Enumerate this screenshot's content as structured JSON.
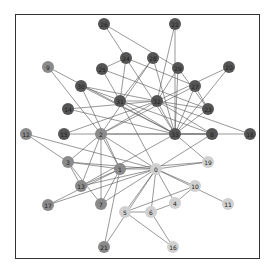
{
  "graph": {
    "title": "",
    "colors": {
      "dark": "#555555",
      "mid": "#8a8a8a",
      "light": "#d0d0d0",
      "edge": "#555555",
      "frame": "#333333"
    },
    "nodes": [
      {
        "id": "0",
        "x": 156,
        "y": 169,
        "shade": "light"
      },
      {
        "id": "1",
        "x": 120,
        "y": 169,
        "shade": "mid"
      },
      {
        "id": "2",
        "x": 101,
        "y": 134,
        "shade": "mid"
      },
      {
        "id": "3",
        "x": 68,
        "y": 162,
        "shade": "mid"
      },
      {
        "id": "4",
        "x": 175,
        "y": 203,
        "shade": "light"
      },
      {
        "id": "5",
        "x": 125,
        "y": 212,
        "shade": "light"
      },
      {
        "id": "6",
        "x": 151,
        "y": 212,
        "shade": "light"
      },
      {
        "id": "7",
        "x": 101,
        "y": 204,
        "shade": "mid"
      },
      {
        "id": "8",
        "x": 212,
        "y": 134,
        "shade": "dark"
      },
      {
        "id": "9",
        "x": 48,
        "y": 67,
        "shade": "mid"
      },
      {
        "id": "10",
        "x": 195,
        "y": 186,
        "shade": "light"
      },
      {
        "id": "11",
        "x": 228,
        "y": 204,
        "shade": "light"
      },
      {
        "id": "12",
        "x": 26,
        "y": 134,
        "shade": "mid"
      },
      {
        "id": "13",
        "x": 81,
        "y": 186,
        "shade": "mid"
      },
      {
        "id": "14",
        "x": 68,
        "y": 109,
        "shade": "dark"
      },
      {
        "id": "15",
        "x": 64,
        "y": 134,
        "shade": "dark"
      },
      {
        "id": "16",
        "x": 173,
        "y": 247,
        "shade": "light"
      },
      {
        "id": "17",
        "x": 48,
        "y": 205,
        "shade": "mid"
      },
      {
        "id": "18",
        "x": 250,
        "y": 134,
        "shade": "dark"
      },
      {
        "id": "19",
        "x": 208,
        "y": 162,
        "shade": "light"
      },
      {
        "id": "20",
        "x": 229,
        "y": 67,
        "shade": "dark"
      },
      {
        "id": "21",
        "x": 104,
        "y": 247,
        "shade": "mid"
      },
      {
        "id": "22",
        "x": 175,
        "y": 24,
        "shade": "dark"
      },
      {
        "id": "23",
        "x": 208,
        "y": 109,
        "shade": "dark"
      },
      {
        "id": "24",
        "x": 126,
        "y": 58,
        "shade": "dark"
      },
      {
        "id": "25",
        "x": 102,
        "y": 69,
        "shade": "dark"
      },
      {
        "id": "26",
        "x": 104,
        "y": 24,
        "shade": "dark"
      },
      {
        "id": "27",
        "x": 195,
        "y": 86,
        "shade": "dark"
      },
      {
        "id": "28",
        "x": 153,
        "y": 58,
        "shade": "dark"
      },
      {
        "id": "29",
        "x": 178,
        "y": 68,
        "shade": "dark"
      },
      {
        "id": "30",
        "x": 81,
        "y": 86,
        "shade": "dark"
      },
      {
        "id": "31",
        "x": 120,
        "y": 101,
        "shade": "dark"
      },
      {
        "id": "32",
        "x": 157,
        "y": 101,
        "shade": "dark"
      },
      {
        "id": "33",
        "x": 175,
        "y": 134,
        "shade": "dark"
      }
    ],
    "edges": [
      [
        "0",
        "1"
      ],
      [
        "0",
        "2"
      ],
      [
        "0",
        "3"
      ],
      [
        "0",
        "4"
      ],
      [
        "0",
        "5"
      ],
      [
        "0",
        "6"
      ],
      [
        "0",
        "7"
      ],
      [
        "0",
        "8"
      ],
      [
        "0",
        "10"
      ],
      [
        "0",
        "11"
      ],
      [
        "0",
        "12"
      ],
      [
        "0",
        "13"
      ],
      [
        "0",
        "17"
      ],
      [
        "0",
        "19"
      ],
      [
        "0",
        "21"
      ],
      [
        "0",
        "31"
      ],
      [
        "1",
        "2"
      ],
      [
        "1",
        "3"
      ],
      [
        "1",
        "7"
      ],
      [
        "1",
        "13"
      ],
      [
        "1",
        "17"
      ],
      [
        "1",
        "19"
      ],
      [
        "1",
        "21"
      ],
      [
        "1",
        "30"
      ],
      [
        "2",
        "3"
      ],
      [
        "2",
        "7"
      ],
      [
        "2",
        "8"
      ],
      [
        "2",
        "9"
      ],
      [
        "2",
        "13"
      ],
      [
        "2",
        "27"
      ],
      [
        "2",
        "28"
      ],
      [
        "2",
        "32"
      ],
      [
        "3",
        "7"
      ],
      [
        "3",
        "12"
      ],
      [
        "3",
        "13"
      ],
      [
        "4",
        "6"
      ],
      [
        "4",
        "10"
      ],
      [
        "5",
        "6"
      ],
      [
        "5",
        "10"
      ],
      [
        "5",
        "16"
      ],
      [
        "6",
        "16"
      ],
      [
        "8",
        "30"
      ],
      [
        "8",
        "32"
      ],
      [
        "8",
        "33"
      ],
      [
        "9",
        "33"
      ],
      [
        "13",
        "33"
      ],
      [
        "14",
        "32"
      ],
      [
        "14",
        "33"
      ],
      [
        "15",
        "32"
      ],
      [
        "15",
        "33"
      ],
      [
        "18",
        "32"
      ],
      [
        "18",
        "33"
      ],
      [
        "19",
        "33"
      ],
      [
        "20",
        "32"
      ],
      [
        "20",
        "33"
      ],
      [
        "22",
        "32"
      ],
      [
        "22",
        "33"
      ],
      [
        "23",
        "25"
      ],
      [
        "23",
        "27"
      ],
      [
        "23",
        "29"
      ],
      [
        "23",
        "32"
      ],
      [
        "23",
        "33"
      ],
      [
        "24",
        "25"
      ],
      [
        "24",
        "27"
      ],
      [
        "24",
        "31"
      ],
      [
        "25",
        "31"
      ],
      [
        "26",
        "29"
      ],
      [
        "26",
        "33"
      ],
      [
        "27",
        "33"
      ],
      [
        "28",
        "31"
      ],
      [
        "28",
        "33"
      ],
      [
        "29",
        "32"
      ],
      [
        "29",
        "33"
      ],
      [
        "30",
        "32"
      ],
      [
        "30",
        "33"
      ],
      [
        "31",
        "32"
      ],
      [
        "31",
        "33"
      ],
      [
        "32",
        "33"
      ]
    ]
  }
}
